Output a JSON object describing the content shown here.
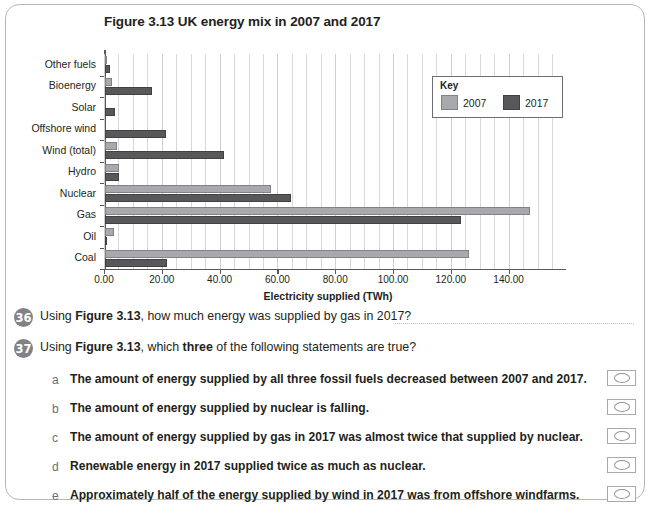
{
  "chart_data": {
    "type": "bar",
    "orientation": "horizontal",
    "title": "Figure 3.13 UK energy mix in 2007 and 2017",
    "xlabel": "Electricity supplied (TWh)",
    "ylabel": "",
    "xlim": [
      0,
      155
    ],
    "xticks": [
      "0.00",
      "20.00",
      "40.00",
      "60.00",
      "80.00",
      "100.00",
      "120.00",
      "140.00"
    ],
    "xtick_values": [
      0,
      20,
      40,
      60,
      80,
      100,
      120,
      140
    ],
    "grid": true,
    "legend_title": "Key",
    "legend_position": "top-right",
    "categories": [
      "Other fuels",
      "Bioenergy",
      "Solar",
      "Offshore wind",
      "Wind (total)",
      "Hydro",
      "Nuclear",
      "Gas",
      "Oil",
      "Coal"
    ],
    "series": [
      {
        "name": "2007",
        "color": "#a7a9ac",
        "values": [
          0.4,
          2.5,
          0.0,
          0.0,
          4.2,
          4.8,
          57.5,
          147.0,
          3.1,
          126.0
        ]
      },
      {
        "name": "2017",
        "color": "#58585a",
        "values": [
          1.6,
          16.4,
          3.5,
          21.0,
          41.0,
          4.9,
          64.5,
          123.0,
          0.7,
          21.5
        ]
      }
    ]
  },
  "questions": [
    {
      "number": "36",
      "text_before": "Using ",
      "text_bold": "Figure 3.13",
      "text_after": ", how much energy was supplied by gas in 2017?",
      "answer_value": ""
    },
    {
      "number": "37",
      "text_before": "Using ",
      "text_bold": "Figure 3.13",
      "text_after": ", which three of the following statements are true?"
    }
  ],
  "q37_parts": {
    "p1": "Using ",
    "b1": "Figure 3.13",
    "p2": ", which ",
    "b2": "three",
    "p3": " of the following statements are true?"
  },
  "options": [
    {
      "letter": "a",
      "text": "The amount of energy supplied by all three fossil fuels decreased between 2007 and 2017.",
      "checked": false
    },
    {
      "letter": "b",
      "text": "The amount of energy supplied by nuclear is falling.",
      "checked": false
    },
    {
      "letter": "c",
      "text": "The amount of energy supplied by gas in 2017 was almost twice that supplied by nuclear.",
      "checked": false
    },
    {
      "letter": "d",
      "text": "Renewable energy in 2017 supplied twice as much as nuclear.",
      "checked": false
    },
    {
      "letter": "e",
      "text": "Approximately half of the energy supplied by wind in 2017 was from offshore windfarms.",
      "checked": false
    }
  ],
  "colors": {
    "series_2007": "#a7a9ac",
    "series_2017": "#58585a",
    "badge": "#808285",
    "border": "#b9b7b4",
    "text": "#231f20"
  }
}
